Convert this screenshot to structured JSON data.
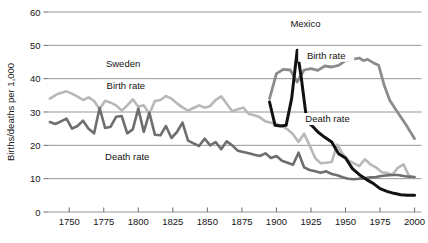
{
  "chart_data": {
    "type": "line",
    "title": "",
    "xlabel": "",
    "ylabel": "Births/deaths per 1,000",
    "xlim": [
      1735,
      2005
    ],
    "ylim": [
      0,
      60
    ],
    "grid": true,
    "legend_position": "inline-annotations",
    "x_ticks": [
      1750,
      1775,
      1800,
      1825,
      1850,
      1875,
      1900,
      1925,
      1950,
      1975,
      2000
    ],
    "y_ticks": [
      0,
      10,
      20,
      30,
      40,
      50,
      60
    ],
    "annotations": [
      {
        "id": "sweden-group",
        "text": "Sweden",
        "x": 1789,
        "y": 44.5
      },
      {
        "id": "sweden-birth",
        "text": "Birth rate",
        "x": 1791,
        "y": 38.0
      },
      {
        "id": "sweden-death",
        "text": "Death rate",
        "x": 1792,
        "y": 16.6
      },
      {
        "id": "mexico-group",
        "text": "Mexico",
        "x": 1921,
        "y": 56.5
      },
      {
        "id": "mexico-birth",
        "text": "Birth rate",
        "x": 1936,
        "y": 47.0
      },
      {
        "id": "mexico-death",
        "text": "Death rate",
        "x": 1937,
        "y": 28.0
      }
    ],
    "series": [
      {
        "name": "Sweden Birth rate",
        "color": "#b8b8b8",
        "width": 2.6,
        "x": [
          1736,
          1742,
          1748,
          1752,
          1756,
          1760,
          1764,
          1768,
          1772,
          1776,
          1780,
          1784,
          1788,
          1792,
          1796,
          1800,
          1804,
          1808,
          1812,
          1816,
          1820,
          1824,
          1828,
          1832,
          1836,
          1840,
          1844,
          1848,
          1852,
          1856,
          1860,
          1864,
          1868,
          1872,
          1876,
          1880,
          1884,
          1888,
          1892,
          1896,
          1900,
          1904,
          1908,
          1912,
          1916,
          1920,
          1924,
          1928,
          1932,
          1936,
          1940,
          1944,
          1948,
          1952,
          1956,
          1960,
          1964,
          1968,
          1972,
          1976,
          1980,
          1984,
          1988,
          1992,
          1996,
          2000
        ],
        "values": [
          34.0,
          35.5,
          36.2,
          35.5,
          34.6,
          33.6,
          34.4,
          33.3,
          30.9,
          33.4,
          32.8,
          32.0,
          30.4,
          32.0,
          33.8,
          31.6,
          32.0,
          29.4,
          33.3,
          33.6,
          34.8,
          34.0,
          32.6,
          31.4,
          30.4,
          31.2,
          32.0,
          31.3,
          31.8,
          33.6,
          34.7,
          32.5,
          30.2,
          30.8,
          31.3,
          29.4,
          29.0,
          28.4,
          27.2,
          26.8,
          26.4,
          25.8,
          24.8,
          23.3,
          21.0,
          23.5,
          20.0,
          16.2,
          14.6,
          14.8,
          15.0,
          20.2,
          17.4,
          15.5,
          14.6,
          13.8,
          15.8,
          14.3,
          13.4,
          12.0,
          11.7,
          11.2,
          13.3,
          14.3,
          10.7,
          10.2
        ]
      },
      {
        "name": "Sweden Death rate",
        "color": "#6e6e6e",
        "width": 2.6,
        "x": [
          1736,
          1740,
          1744,
          1748,
          1752,
          1756,
          1760,
          1764,
          1768,
          1772,
          1776,
          1780,
          1784,
          1788,
          1792,
          1796,
          1800,
          1804,
          1808,
          1812,
          1816,
          1820,
          1824,
          1828,
          1832,
          1836,
          1840,
          1844,
          1848,
          1852,
          1856,
          1860,
          1864,
          1868,
          1872,
          1876,
          1880,
          1884,
          1888,
          1892,
          1896,
          1900,
          1904,
          1908,
          1912,
          1916,
          1920,
          1924,
          1928,
          1932,
          1936,
          1940,
          1944,
          1948,
          1952,
          1956,
          1960,
          1964,
          1968,
          1972,
          1976,
          1980,
          1984,
          1988,
          1992,
          1996,
          2000
        ],
        "values": [
          27.0,
          26.4,
          27.2,
          28.0,
          25.0,
          25.8,
          27.4,
          25.0,
          23.6,
          31.2,
          25.2,
          25.6,
          28.6,
          28.8,
          23.6,
          24.8,
          31.0,
          24.0,
          29.8,
          23.2,
          23.0,
          25.8,
          22.2,
          24.0,
          26.8,
          21.4,
          20.6,
          19.8,
          22.0,
          20.0,
          21.0,
          18.8,
          21.2,
          20.0,
          18.4,
          18.0,
          17.6,
          17.2,
          16.8,
          17.6,
          16.2,
          16.8,
          15.4,
          14.8,
          14.2,
          17.8,
          13.4,
          12.6,
          12.2,
          11.8,
          12.2,
          11.4,
          11.0,
          10.4,
          10.0,
          9.8,
          10.0,
          10.1,
          10.4,
          10.5,
          10.8,
          11.0,
          11.1,
          11.1,
          10.8,
          10.6,
          10.5
        ]
      },
      {
        "name": "Mexico Birth rate",
        "color": "#8c8c8c",
        "width": 2.8,
        "x": [
          1895,
          1900,
          1905,
          1910,
          1915,
          1920,
          1925,
          1930,
          1935,
          1940,
          1945,
          1950,
          1955,
          1960,
          1963,
          1966,
          1970,
          1974,
          1978,
          1982,
          1986,
          1990,
          1994,
          2000
        ],
        "values": [
          34.0,
          41.5,
          42.8,
          42.6,
          39.0,
          42.6,
          43.0,
          42.5,
          43.8,
          43.5,
          44.0,
          45.4,
          45.8,
          46.2,
          45.4,
          45.8,
          44.8,
          44.0,
          38.0,
          33.5,
          31.0,
          28.5,
          26.0,
          22.0
        ]
      },
      {
        "name": "Mexico Death rate",
        "color": "#121212",
        "width": 3.0,
        "x": [
          1895,
          1899,
          1903,
          1907,
          1911,
          1915,
          1918,
          1922,
          1926,
          1930,
          1935,
          1940,
          1945,
          1950,
          1955,
          1960,
          1965,
          1970,
          1975,
          1980,
          1985,
          1990,
          1995,
          2000
        ],
        "values": [
          33.0,
          26.0,
          25.8,
          26.0,
          34.0,
          48.5,
          40.2,
          27.2,
          25.8,
          24.0,
          22.4,
          21.0,
          17.5,
          16.2,
          13.0,
          11.2,
          9.8,
          8.6,
          7.0,
          6.2,
          5.6,
          5.2,
          5.0,
          5.0
        ]
      }
    ]
  }
}
